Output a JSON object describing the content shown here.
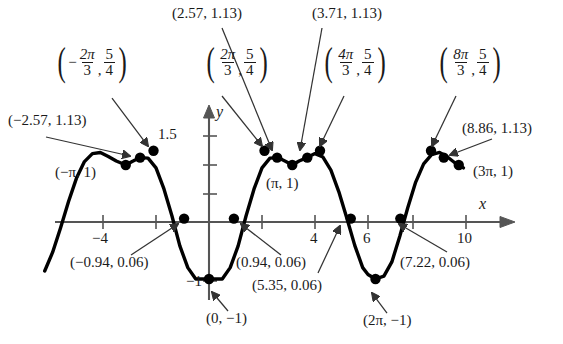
{
  "figure": {
    "kind": "cartesian-graph",
    "stroke_color": "#000000",
    "axis_color": "#555555",
    "background": "#ffffff"
  },
  "axes": {
    "x_axis_label": "x",
    "y_axis_label": "y",
    "x_ticks": [
      {
        "label": "-4",
        "value": -4
      },
      {
        "label": "",
        "value": -2
      },
      {
        "label": "",
        "value": 2
      },
      {
        "label": "4",
        "value": 4
      },
      {
        "label": "6",
        "value": 6
      },
      {
        "label": "",
        "value": 8
      },
      {
        "label": "10",
        "value": 10
      }
    ],
    "y_ticks": [
      {
        "label": "1.5",
        "value": 1.5
      },
      {
        "label": "",
        "value": 1.0
      },
      {
        "label": "",
        "value": 0.5
      },
      {
        "label": "-1",
        "value": -1
      }
    ],
    "xlim": [
      -6.2,
      11.6
    ],
    "ylim": [
      -1.45,
      1.85
    ]
  },
  "chart_data": {
    "type": "line",
    "title": "",
    "xlabel": "x",
    "ylabel": "y",
    "xlim": [
      -6.2,
      11.6
    ],
    "ylim": [
      -1.45,
      1.85
    ],
    "grid": false,
    "legend": "none",
    "series": [
      {
        "name": "curve",
        "x": [
          -6.2,
          -5.9,
          -5.6,
          -5.3,
          -5.0,
          -4.7,
          -4.4,
          -4.1,
          -3.8,
          -3.5,
          -3.1416,
          -2.9,
          -2.6,
          -2.3,
          -2.0,
          -1.7,
          -1.4,
          -1.1,
          -0.8,
          -0.5,
          -0.2,
          0,
          0.2,
          0.5,
          0.8,
          1.1,
          1.4,
          1.7,
          2.0,
          2.3,
          2.6,
          2.9,
          3.1416,
          3.4,
          3.7,
          4.0,
          4.3,
          4.6,
          4.9,
          5.2,
          5.5,
          5.8,
          6.0,
          6.2832,
          6.6,
          6.9,
          7.2,
          7.5,
          7.8,
          8.1,
          8.4,
          8.7,
          9.0,
          9.3,
          9.4248,
          9.6
        ],
        "y": [
          -0.86,
          -0.53,
          -0.1,
          0.36,
          0.77,
          1.06,
          1.2,
          1.22,
          1.15,
          1.07,
          1.0,
          1.06,
          1.13,
          1.12,
          0.95,
          0.58,
          0.11,
          -0.42,
          -0.8,
          -1.0,
          -1.0,
          -1.0,
          -1.0,
          -1.0,
          -0.8,
          -0.42,
          0.11,
          0.58,
          0.95,
          1.12,
          1.13,
          1.06,
          1.0,
          1.07,
          1.13,
          1.2,
          1.14,
          0.91,
          0.53,
          0.07,
          -0.41,
          -0.8,
          -0.92,
          -1.0,
          -0.95,
          -0.7,
          -0.25,
          0.25,
          0.7,
          1.02,
          1.18,
          1.22,
          1.14,
          1.03,
          1.0,
          0.95
        ]
      }
    ],
    "marked_points": [
      {
        "x": -3.1416,
        "y": 1.0,
        "label": "(-π, 1)"
      },
      {
        "x": -2.6,
        "y": 1.13,
        "label": "(-2.57, 1.13)"
      },
      {
        "x": -2.0944,
        "y": 1.25,
        "label": "(-2π/3, 5/4)"
      },
      {
        "x": -0.94,
        "y": 0.06,
        "label": "(-0.94, 0.06)"
      },
      {
        "x": 0,
        "y": -1.0,
        "label": "(0, -1)"
      },
      {
        "x": 0.94,
        "y": 0.06,
        "label": "(0.94, 0.06)"
      },
      {
        "x": 2.0944,
        "y": 1.25,
        "label": "(2π/3, 5/4)"
      },
      {
        "x": 2.57,
        "y": 1.13,
        "label": "(2.57, 1.13)"
      },
      {
        "x": 3.1416,
        "y": 1.0,
        "label": "(π, 1)"
      },
      {
        "x": 3.71,
        "y": 1.13,
        "label": "(3.71, 1.13)"
      },
      {
        "x": 4.1888,
        "y": 1.25,
        "label": "(4π/3, 5/4)"
      },
      {
        "x": 5.35,
        "y": 0.06,
        "label": "(5.35, 0.06)"
      },
      {
        "x": 6.2832,
        "y": -1.0,
        "label": "(2π, -1)"
      },
      {
        "x": 7.22,
        "y": 0.06,
        "label": "(7.22, 0.06)"
      },
      {
        "x": 8.3776,
        "y": 1.25,
        "label": "(8π/3, 5/4)"
      },
      {
        "x": 8.86,
        "y": 1.13,
        "label": "(8.86, 1.13)"
      },
      {
        "x": 9.4248,
        "y": 1.0,
        "label": "(3π, 1)"
      }
    ]
  },
  "labels": {
    "frac_neg_2pi_3": {
      "open": "(",
      "neg": "−",
      "num1": "2π",
      "den1": "3",
      "comma": ",",
      "num2": "5",
      "den2": "4",
      "close": ")"
    },
    "frac_2pi_3": {
      "open": "(",
      "neg": "",
      "num1": "2π",
      "den1": "3",
      "comma": ",",
      "num2": "5",
      "den2": "4",
      "close": ")"
    },
    "frac_4pi_3": {
      "open": "(",
      "neg": "",
      "num1": "4π",
      "den1": "3",
      "comma": ",",
      "num2": "5",
      "den2": "4",
      "close": ")"
    },
    "frac_8pi_3": {
      "open": "(",
      "neg": "",
      "num1": "8π",
      "den1": "3",
      "comma": ",",
      "num2": "5",
      "den2": "4",
      "close": ")"
    },
    "p_neg257": "(−2.57, 1.13)",
    "p_257": "(2.57, 1.13)",
    "p_371": "(3.71, 1.13)",
    "p_886": "(8.86, 1.13)",
    "p_neg_pi_1": "(−π, 1)",
    "p_pi_1": "(π, 1)",
    "p_3pi_1": "(3π, 1)",
    "p_neg094": "(−0.94, 0.06)",
    "p_094": "(0.94, 0.06)",
    "p_535": "(5.35, 0.06)",
    "p_722": "(7.22, 0.06)",
    "p_0_neg1": "(0, −1)",
    "p_2pi_neg1": "(2π, −1)",
    "y_15": "1.5",
    "y_neg1": "−1",
    "x_neg4": "−4",
    "x_4": "4",
    "x_6": "6",
    "x_10": "10",
    "axis_x": "x",
    "axis_y": "y"
  }
}
